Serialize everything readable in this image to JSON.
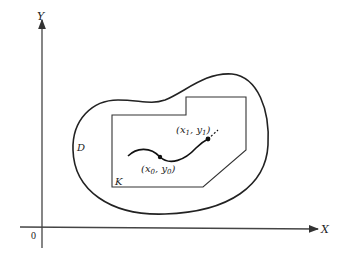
{
  "figure": {
    "axes": {
      "x_label": "X",
      "y_label": "Y",
      "origin_label": "0"
    },
    "regions": {
      "outer_label": "D",
      "inner_label": "K"
    },
    "points": {
      "start": {
        "label_x": "x",
        "label_x_sub": "0",
        "label_y": "y",
        "label_y_sub": "0"
      },
      "end": {
        "label_x": "x",
        "label_x_sub": "1",
        "label_y": "y",
        "label_y_sub": "1"
      }
    },
    "colors": {
      "stroke": "#222222",
      "background": "#ffffff"
    }
  }
}
